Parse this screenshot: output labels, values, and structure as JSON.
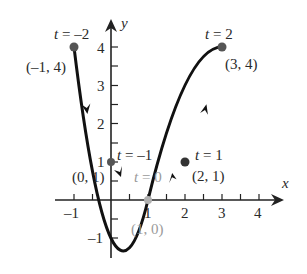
{
  "diagram": {
    "type": "parametric-curve",
    "axes": {
      "x_label": "x",
      "y_label": "y",
      "x_ticks": [
        "-1",
        "1",
        "2",
        "3",
        "4"
      ],
      "y_ticks": [
        "-1",
        "1",
        "2",
        "3",
        "4"
      ]
    },
    "points": [
      {
        "t_label": "t = -2",
        "coord_label": "(-1, 4)",
        "x": -1,
        "y": 4,
        "color": "#555555"
      },
      {
        "t_label": "t = -1",
        "coord_label": "(0, 1)",
        "x": 0,
        "y": 1,
        "color": "#555555"
      },
      {
        "t_label": "t = 0",
        "coord_label": "(1, 0)",
        "x": 1,
        "y": 0,
        "color": "#aaaaaa"
      },
      {
        "t_label": "t = 1",
        "coord_label": "(2, 1)",
        "x": 2,
        "y": 1,
        "color": "#333333"
      },
      {
        "t_label": "t = 2",
        "coord_label": "(3, 4)",
        "x": 3,
        "y": 4,
        "color": "#555555"
      }
    ],
    "curve_color": "#111111"
  }
}
